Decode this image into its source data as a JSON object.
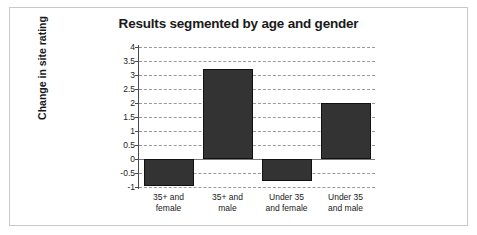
{
  "chart_data": {
    "type": "bar",
    "title": "Results segmented by age and gender",
    "xlabel": "",
    "ylabel": "Change in site rating",
    "categories": [
      "35+ and female",
      "35+ and male",
      "Under 35 and female",
      "Under 35 and male"
    ],
    "category_lines": [
      [
        "35+ and",
        "female"
      ],
      [
        "35+ and",
        "male"
      ],
      [
        "Under 35",
        "and female"
      ],
      [
        "Under 35",
        "and male"
      ]
    ],
    "values": [
      -0.95,
      3.2,
      -0.8,
      2.0
    ],
    "ylim": [
      -1,
      4
    ],
    "yticks": [
      4,
      3.5,
      3,
      2.5,
      2,
      1.5,
      1,
      0.5,
      0,
      -0.5,
      -1
    ],
    "ytick_labels": [
      "4",
      "3.5",
      "3",
      "2.5",
      "2",
      "1.5",
      "1",
      "0.5",
      "0",
      "-0.5",
      "-1"
    ],
    "grid": true,
    "legend": "none",
    "bar_color": "#333333",
    "gridline_color": "#9a9a9a",
    "axis_color": "#4a4a4a",
    "frame_color": "#c9c9c9",
    "background": "#ffffff"
  }
}
